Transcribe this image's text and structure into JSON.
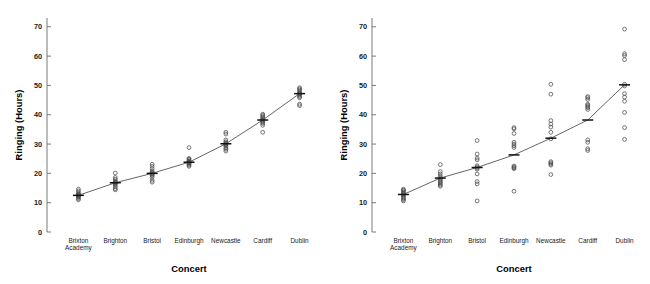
{
  "figure": {
    "panel_count": 2,
    "background": "#ffffff"
  },
  "chart_data": [
    {
      "panel": "left",
      "type": "scatter",
      "title": "",
      "xlabel": "Concert",
      "ylabel": "Ringing (Hours)",
      "categories": [
        "Brixton Academy",
        "Brighton",
        "Bristol",
        "Edinburgh",
        "Newcastle",
        "Cardiff",
        "Dublin"
      ],
      "ylim": [
        0,
        73
      ],
      "yticks": [
        0,
        10,
        20,
        30,
        40,
        50,
        60,
        70
      ],
      "grid": false,
      "legend": "none",
      "series": [
        {
          "name": "Mean (fitted line)",
          "values": [
            12.5,
            16.8,
            20.0,
            23.8,
            30.1,
            38.2,
            47.2
          ]
        }
      ],
      "points": [
        {
          "category": "Brixton Academy",
          "values": [
            11.0,
            11.4,
            11.8,
            12.0,
            12.3,
            12.5,
            12.6,
            12.8,
            13.0,
            13.4,
            14.0,
            14.6
          ]
        },
        {
          "category": "Brighton",
          "values": [
            14.4,
            14.8,
            15.4,
            16.0,
            16.4,
            16.7,
            16.9,
            17.1,
            17.4,
            18.0,
            18.6,
            20.1
          ]
        },
        {
          "category": "Bristol",
          "values": [
            17.0,
            17.6,
            18.6,
            19.2,
            19.6,
            19.9,
            20.1,
            20.4,
            20.8,
            21.6,
            22.4,
            23.1
          ]
        },
        {
          "category": "Edinburgh",
          "values": [
            22.4,
            22.8,
            23.1,
            23.4,
            23.6,
            23.8,
            23.9,
            24.1,
            24.4,
            24.8,
            25.1,
            28.8
          ]
        },
        {
          "category": "Newcastle",
          "values": [
            27.6,
            28.2,
            28.6,
            29.2,
            29.6,
            29.9,
            30.1,
            30.4,
            30.8,
            31.4,
            33.4,
            34.0
          ]
        },
        {
          "category": "Cardiff",
          "values": [
            34.0,
            36.4,
            37.0,
            37.4,
            37.8,
            38.1,
            38.3,
            38.6,
            39.0,
            39.4,
            39.8,
            40.2
          ]
        },
        {
          "category": "Dublin",
          "values": [
            43.1,
            43.6,
            45.8,
            46.2,
            46.6,
            47.0,
            47.2,
            47.5,
            47.9,
            48.4,
            48.8,
            49.2
          ]
        }
      ]
    },
    {
      "panel": "right",
      "type": "scatter",
      "title": "",
      "xlabel": "Concert",
      "ylabel": "Ringing (Hours)",
      "categories": [
        "Brixton Academy",
        "Brighton",
        "Bristol",
        "Edinburgh",
        "Newcastle",
        "Cardiff",
        "Dublin"
      ],
      "ylim": [
        0,
        73
      ],
      "yticks": [
        0,
        10,
        20,
        30,
        40,
        50,
        60,
        70
      ],
      "grid": false,
      "legend": "none",
      "series": [
        {
          "name": "Mean (fitted line)",
          "values": [
            12.8,
            18.4,
            22.0,
            26.3,
            32.0,
            38.2,
            50.2
          ]
        }
      ],
      "points": [
        {
          "category": "Brixton Academy",
          "values": [
            10.6,
            11.0,
            11.4,
            11.8,
            12.2,
            12.6,
            13.0,
            13.2,
            13.6,
            14.0,
            14.3,
            14.6
          ]
        },
        {
          "category": "Brighton",
          "values": [
            15.6,
            16.0,
            16.4,
            16.8,
            17.2,
            17.6,
            18.0,
            18.4,
            19.0,
            19.8,
            20.6,
            23.0
          ]
        },
        {
          "category": "Bristol",
          "values": [
            10.6,
            16.4,
            17.2,
            19.8,
            21.4,
            21.8,
            22.2,
            22.6,
            24.6,
            25.2,
            26.6,
            31.2
          ]
        },
        {
          "category": "Edinburgh",
          "values": [
            13.9,
            21.6,
            21.9,
            22.2,
            22.5,
            28.8,
            29.4,
            30.0,
            30.6,
            33.6,
            35.2,
            35.6
          ]
        },
        {
          "category": "Newcastle",
          "values": [
            19.6,
            22.8,
            23.2,
            23.6,
            24.0,
            31.8,
            34.0,
            35.8,
            36.8,
            38.0,
            47.0,
            50.4
          ]
        },
        {
          "category": "Cardiff",
          "values": [
            27.8,
            28.4,
            30.6,
            31.4,
            41.8,
            42.4,
            42.8,
            43.2,
            43.6,
            45.2,
            45.8,
            46.2
          ]
        },
        {
          "category": "Dublin",
          "values": [
            31.6,
            35.6,
            40.8,
            44.6,
            46.0,
            47.2,
            49.8,
            50.4,
            58.8,
            60.2,
            60.8,
            69.2
          ]
        }
      ]
    }
  ]
}
